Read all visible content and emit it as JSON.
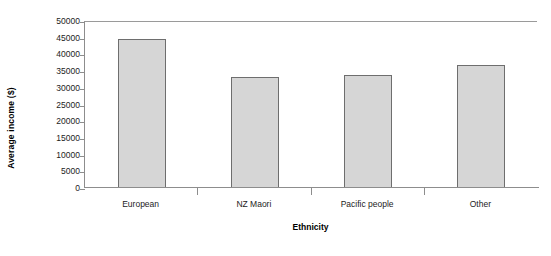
{
  "chart_data": {
    "type": "bar",
    "title": "",
    "xlabel": "Ethnicity",
    "ylabel": "Average income ($)",
    "categories": [
      "European",
      "NZ Maori",
      "Pacific people",
      "Other"
    ],
    "values": [
      44500,
      33300,
      33800,
      36800
    ],
    "ylim": [
      0,
      50000
    ],
    "yticks": [
      0,
      5000,
      10000,
      15000,
      20000,
      25000,
      30000,
      35000,
      40000,
      45000,
      50000
    ],
    "ytick_labels": [
      "0",
      "5000",
      "10000",
      "15000",
      "20000",
      "25000",
      "30000",
      "35000",
      "40000",
      "45000",
      "50000"
    ],
    "grid": false,
    "legend": null,
    "bar_fill_color": "#d6d6d6",
    "bar_border_color": "#6e6e6e",
    "axis_color": "#8d8d8d",
    "background_color": "#ffffff"
  }
}
